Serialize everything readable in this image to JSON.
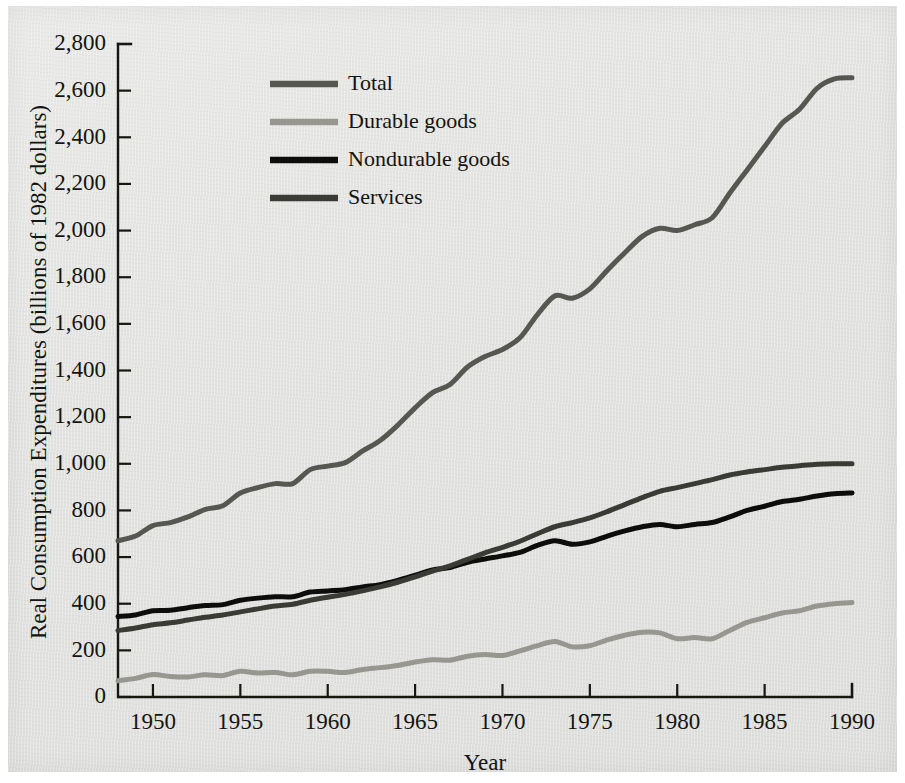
{
  "figure": {
    "background_color": "#e4e4e2",
    "ylabel": "Real Consumption Expenditures (billions of 1982 dollars)",
    "xlabel": "Year"
  },
  "chart_data": {
    "type": "line",
    "title": "",
    "xlabel": "Year",
    "ylabel": "Real Consumption Expenditures (billions of 1982 dollars)",
    "xlim": [
      1948,
      1990
    ],
    "ylim": [
      0,
      2800
    ],
    "grid": false,
    "legend_position": "top-left inside",
    "xticks": [
      1950,
      1955,
      1960,
      1965,
      1970,
      1975,
      1980,
      1985,
      1990
    ],
    "xtick_labels": [
      "1950",
      "1955",
      "1960",
      "1965",
      "1970",
      "1975",
      "1980",
      "1985",
      "1990"
    ],
    "yticks": [
      0,
      200,
      400,
      600,
      800,
      1000,
      1200,
      1400,
      1600,
      1800,
      2000,
      2200,
      2400,
      2600,
      2800
    ],
    "ytick_labels": [
      "0",
      "200",
      "400",
      "600",
      "800",
      "1,000",
      "1,200",
      "1,400",
      "1,600",
      "1,800",
      "2,000",
      "2,200",
      "2,400",
      "2,600",
      "2,800"
    ],
    "x": [
      1948,
      1949,
      1950,
      1951,
      1952,
      1953,
      1954,
      1955,
      1956,
      1957,
      1958,
      1959,
      1960,
      1961,
      1962,
      1963,
      1964,
      1965,
      1966,
      1967,
      1968,
      1969,
      1970,
      1971,
      1972,
      1973,
      1974,
      1975,
      1976,
      1977,
      1978,
      1979,
      1980,
      1981,
      1982,
      1983,
      1984,
      1985,
      1986,
      1987,
      1988,
      1989,
      1990
    ],
    "series": [
      {
        "name": "Total",
        "color": "#575752",
        "width": 5.0,
        "values": [
          670,
          690,
          735,
          748,
          772,
          805,
          820,
          875,
          898,
          915,
          915,
          975,
          990,
          1005,
          1055,
          1100,
          1165,
          1240,
          1305,
          1340,
          1415,
          1460,
          1490,
          1540,
          1640,
          1720,
          1710,
          1750,
          1830,
          1905,
          1975,
          2010,
          2000,
          2025,
          2055,
          2160,
          2260,
          2360,
          2460,
          2520,
          2610,
          2650,
          2655
        ]
      },
      {
        "name": "Durable goods",
        "color": "#97978f",
        "width": 5.0,
        "values": [
          70,
          80,
          96,
          88,
          86,
          95,
          92,
          110,
          103,
          105,
          95,
          110,
          110,
          105,
          118,
          126,
          135,
          150,
          160,
          158,
          175,
          182,
          178,
          198,
          220,
          238,
          215,
          220,
          245,
          265,
          278,
          275,
          250,
          255,
          250,
          285,
          320,
          340,
          360,
          370,
          390,
          400,
          405
        ]
      },
      {
        "name": "Nondurable goods",
        "color": "#0d0d0b",
        "width": 5.0,
        "values": [
          345,
          352,
          370,
          372,
          383,
          392,
          396,
          415,
          424,
          430,
          430,
          450,
          455,
          460,
          472,
          482,
          500,
          522,
          545,
          555,
          578,
          592,
          605,
          620,
          650,
          670,
          655,
          665,
          690,
          712,
          730,
          740,
          730,
          740,
          748,
          772,
          800,
          818,
          838,
          848,
          862,
          872,
          875
        ]
      },
      {
        "name": "Services",
        "color": "#3b3b35",
        "width": 5.0,
        "values": [
          285,
          296,
          310,
          318,
          330,
          342,
          352,
          365,
          378,
          390,
          398,
          415,
          428,
          440,
          455,
          472,
          492,
          515,
          540,
          562,
          590,
          618,
          642,
          668,
          700,
          730,
          748,
          768,
          795,
          825,
          855,
          882,
          898,
          915,
          932,
          952,
          965,
          975,
          985,
          992,
          998,
          1000,
          1000
        ]
      }
    ]
  },
  "legend": {
    "entries": [
      {
        "label": "Total",
        "color": "#575752"
      },
      {
        "label": "Durable goods",
        "color": "#97978f"
      },
      {
        "label": "Nondurable goods",
        "color": "#0d0d0b"
      },
      {
        "label": "Services",
        "color": "#3b3b35"
      }
    ]
  }
}
